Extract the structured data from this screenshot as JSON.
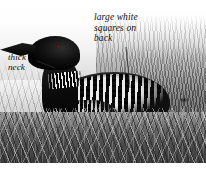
{
  "figure": {
    "kind": "field-guide-photo",
    "rendering": "black-and-white photograph",
    "palette": {
      "plumage_black": "#0b0b0b",
      "plumage_white": "#ffffff",
      "eye_red": "#5a2320",
      "background_sky": "#ffffff",
      "grass_mid": "#6a6a6a",
      "annotation_text": "#111111",
      "leader_line": "#333333"
    }
  },
  "annotations": [
    {
      "id": "squares",
      "text": "large white\nsquares on\nback",
      "lines": [
        "large white",
        "squares on",
        "back"
      ],
      "points_to": "checkered back plumage",
      "leader": {
        "x1": 126,
        "y1": 47,
        "x2": 130,
        "y2": 88
      }
    },
    {
      "id": "neck",
      "text": "thick\nneck",
      "lines": [
        "thick",
        "neck"
      ],
      "points_to": "striped neck collar",
      "leader": {
        "x1": 37,
        "y1": 61,
        "x2": 55,
        "y2": 68
      }
    }
  ],
  "bird_parts": {
    "bill": "dagger-shaped black bill",
    "head": "glossy black head",
    "eye": "dark red eye",
    "neck": "thick black neck with white vertical striped collar",
    "breast": "white breast",
    "back": "black back with rows of large white squares",
    "flank": "finely checkered black and white flank"
  },
  "scene": {
    "foreground": "matted grass and reed nest",
    "background": "tall marsh reeds fading to white sky"
  }
}
